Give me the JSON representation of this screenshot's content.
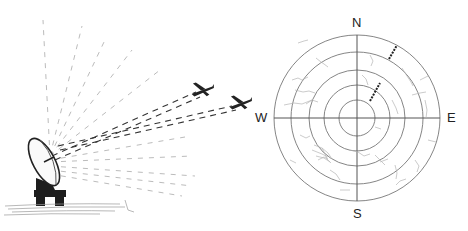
{
  "figure": {
    "left_panel": {
      "antenna": "radar-dish-antenna",
      "targets": [
        "aircraft-1",
        "aircraft-2"
      ]
    },
    "right_panel": {
      "display": "ppi-radar-scope",
      "compass_labels": {
        "north": "N",
        "south": "S",
        "east": "E",
        "west": "W"
      },
      "range_rings": 5,
      "target_blips": 2
    }
  },
  "colors": {
    "ink": "#222222",
    "ring": "#777777",
    "clutter": "#b5b5b5",
    "background": "#ffffff"
  }
}
